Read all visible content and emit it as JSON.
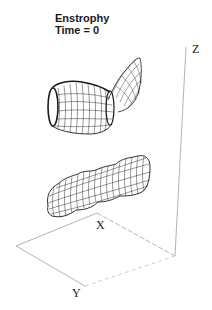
{
  "figure": {
    "title_line1": "Enstrophy",
    "title_line2": "Time = 0",
    "axes": {
      "x_label": "X",
      "y_label": "Y",
      "z_label": "Z"
    },
    "surfaces": [
      {
        "name": "upper-vortex-tube",
        "description": "wireframe isosurface, bent tube rising to upper right"
      },
      {
        "name": "lower-vortex-tube",
        "description": "wireframe isosurface, undulating tube"
      }
    ],
    "colors": {
      "background": "#ffffff",
      "wireframe": "#1a1a1a",
      "axes": "#9a9a9a",
      "text": "#1a1a1a"
    }
  }
}
